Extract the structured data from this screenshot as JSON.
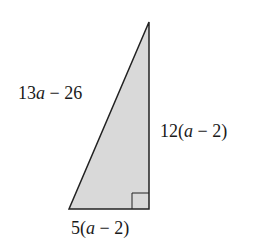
{
  "figure": {
    "type": "right-triangle",
    "fill_color": "#d9d9d9",
    "stroke_color": "#222222",
    "labels": {
      "hypotenuse": {
        "prefix": "13",
        "var": "a",
        "suffix": " − 26"
      },
      "vertical_leg": {
        "prefix": "12(",
        "var": "a",
        "suffix": " − 2)"
      },
      "base": {
        "prefix": "5(",
        "var": "a",
        "suffix": " − 2)"
      }
    },
    "right_angle_marker": true
  }
}
